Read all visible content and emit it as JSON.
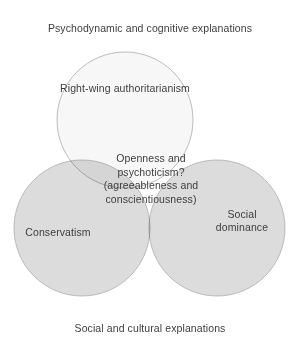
{
  "diagram": {
    "type": "venn",
    "set_count": 3,
    "background_color": "#ffffff",
    "text_color": "#3d3d3d",
    "stroke_color": "#b4b4b4",
    "outer_labels": {
      "top": "Psychodynamic and cognitive explanations",
      "bottom": "Social and cultural explanations"
    },
    "circles": [
      {
        "id": "top",
        "label": "Right-wing authoritarianism",
        "fill_color": "#f7f7f7",
        "cx": 125,
        "cy": 120,
        "r": 68
      },
      {
        "id": "left",
        "label": "Conservatism",
        "fill_color": "#dcdcdc",
        "cx": 82,
        "cy": 228,
        "r": 68
      },
      {
        "id": "right",
        "label_line_1": "Social",
        "label_line_2": "dominance",
        "fill_color": "#dcdcdc",
        "cx": 217,
        "cy": 228,
        "r": 68
      }
    ],
    "intersection": {
      "line_1": "Openness and",
      "line_2": "psychoticism?",
      "line_3": "(agreeableness and",
      "line_4": "conscientiousness)"
    }
  }
}
